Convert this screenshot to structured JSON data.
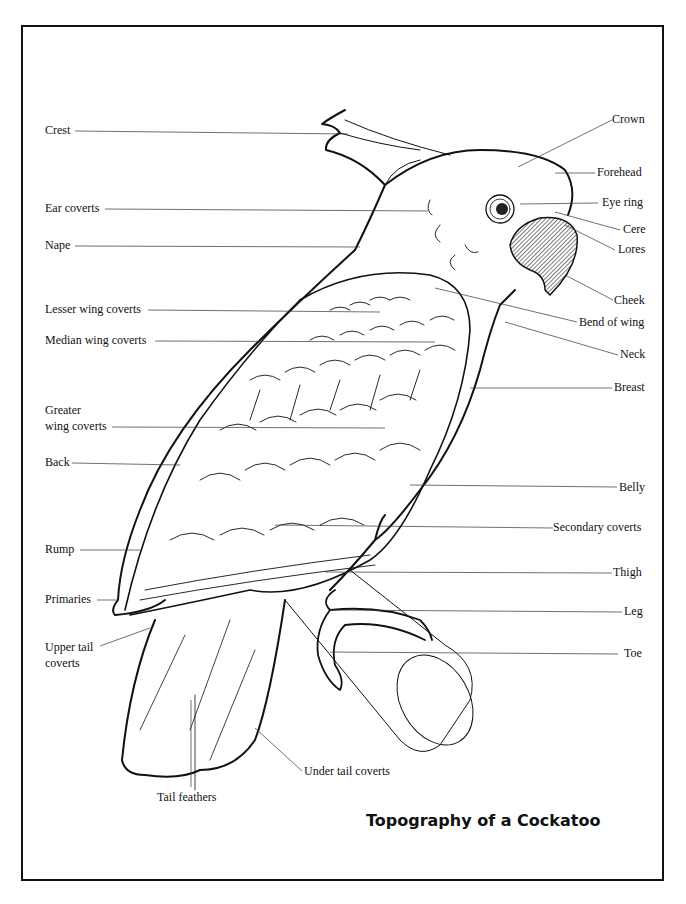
{
  "diagram": {
    "title": "Topography of a Cockatoo",
    "labels_left": [
      {
        "id": "crest",
        "text": "Crest"
      },
      {
        "id": "ear-coverts",
        "text": "Ear coverts"
      },
      {
        "id": "nape",
        "text": "Nape"
      },
      {
        "id": "lesser-wing-coverts",
        "text": "Lesser wing coverts"
      },
      {
        "id": "median-wing-coverts",
        "text": "Median wing coverts"
      },
      {
        "id": "greater-wing-coverts-1",
        "text": "Greater"
      },
      {
        "id": "greater-wing-coverts-2",
        "text": "wing coverts"
      },
      {
        "id": "back",
        "text": "Back"
      },
      {
        "id": "rump",
        "text": "Rump"
      },
      {
        "id": "primaries",
        "text": "Primaries"
      },
      {
        "id": "upper-tail-coverts-1",
        "text": "Upper tail"
      },
      {
        "id": "upper-tail-coverts-2",
        "text": "coverts"
      }
    ],
    "labels_right": [
      {
        "id": "crown",
        "text": "Crown"
      },
      {
        "id": "forehead",
        "text": "Forehead"
      },
      {
        "id": "eye-ring",
        "text": "Eye ring"
      },
      {
        "id": "cere",
        "text": "Cere"
      },
      {
        "id": "lores",
        "text": "Lores"
      },
      {
        "id": "cheek",
        "text": "Cheek"
      },
      {
        "id": "bend-of-wing",
        "text": "Bend of wing"
      },
      {
        "id": "neck",
        "text": "Neck"
      },
      {
        "id": "breast",
        "text": "Breast"
      },
      {
        "id": "belly",
        "text": "Belly"
      },
      {
        "id": "secondary-coverts",
        "text": "Secondary coverts"
      },
      {
        "id": "thigh",
        "text": "Thigh"
      },
      {
        "id": "leg",
        "text": "Leg"
      },
      {
        "id": "toe",
        "text": "Toe"
      }
    ],
    "labels_bottom": [
      {
        "id": "tail-feathers",
        "text": "Tail feathers"
      },
      {
        "id": "under-tail-coverts",
        "text": "Under tail coverts"
      }
    ]
  }
}
